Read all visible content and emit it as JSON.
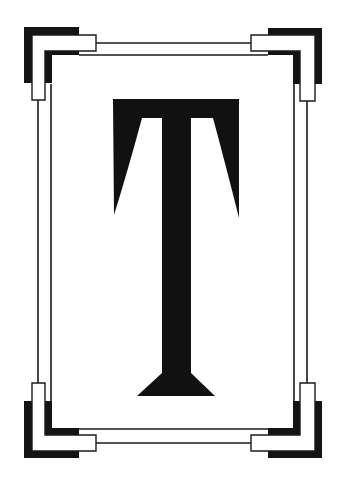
{
  "letter": {
    "glyph": "T",
    "fill_color": "#111111"
  },
  "frame": {
    "line_color": "#1a1a1a",
    "ornament_color": "#141414",
    "background_color": "#ffffff"
  }
}
